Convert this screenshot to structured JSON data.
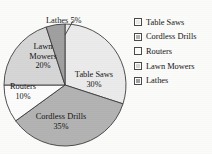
{
  "chart_data": {
    "type": "pie",
    "title": "DISTRIBUTION OF PRODUCT SALES",
    "categories": [
      "Table Saws",
      "Cordless Drills",
      "Routers",
      "Lawn Mowers",
      "Lathes"
    ],
    "values": [
      30,
      35,
      10,
      20,
      5
    ],
    "value_labels": [
      "30%",
      "35%",
      "10%",
      "20%",
      "5%"
    ],
    "units": "percent",
    "total": 100,
    "start_angle_deg": 0,
    "direction": "clockwise",
    "legend_position": "right",
    "grid": false,
    "xlabel": "",
    "ylabel": "",
    "colors": [
      "#ebebeb",
      "#b3b3b3",
      "#fcfcfc",
      "#d6d6d6",
      "#a0a0a0"
    ],
    "stroke": "#3d3d3d",
    "slices": [
      {
        "name": "Table Saws",
        "value": 30,
        "label": "Table Saws",
        "pct_label": "30%",
        "color": "#ebebeb",
        "label_placement": "inside"
      },
      {
        "name": "Cordless Drills",
        "value": 35,
        "label": "Cordless Drills",
        "pct_label": "35%",
        "color": "#b3b3b3",
        "label_placement": "inside"
      },
      {
        "name": "Routers",
        "value": 10,
        "label": "Routers",
        "pct_label": "10%",
        "color": "#fcfcfc",
        "label_placement": "inside"
      },
      {
        "name": "Lawn Mowers",
        "value": 20,
        "label": "Lawn",
        "label_line2": "Mowers",
        "pct_label": "20%",
        "color": "#d6d6d6",
        "label_placement": "inside"
      },
      {
        "name": "Lathes",
        "value": 5,
        "label": "Lathes 5%",
        "pct_label": "5%",
        "color": "#a0a0a0",
        "label_placement": "callout"
      }
    ]
  },
  "legend": {
    "items": [
      {
        "label": "Table Saws",
        "color": "#ebebeb"
      },
      {
        "label": "Cordless Drills",
        "color": "#b3b3b3"
      },
      {
        "label": "Routers",
        "color": "#fcfcfc"
      },
      {
        "label": "Lawn Mowers",
        "color": "#d6d6d6"
      },
      {
        "label": "Lathes",
        "color": "#a0a0a0"
      }
    ]
  }
}
